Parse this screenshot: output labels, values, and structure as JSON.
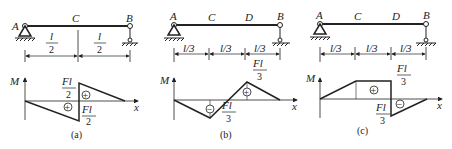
{
  "panels": [
    {
      "id": "a",
      "caption": "(a)",
      "points": {
        "left": "A",
        "mid": "C",
        "right": "B"
      },
      "dims": [
        {
          "num": "l",
          "den": "2"
        },
        {
          "num": "l",
          "den": "2"
        }
      ],
      "moment_labels": [
        {
          "num": "Fl",
          "den": "2"
        },
        {
          "num": "Fl",
          "den": "2"
        }
      ],
      "axis": {
        "y": "M",
        "x": "x"
      },
      "signs": [
        "+",
        "+"
      ]
    },
    {
      "id": "b",
      "caption": "(b)",
      "points": {
        "left": "A",
        "c": "C",
        "d": "D",
        "right": "B"
      },
      "dims": [
        "l/3",
        "l/3",
        "l/3"
      ],
      "moment_labels": [
        {
          "num": "Fl",
          "den": "3"
        },
        {
          "num": "Fl",
          "den": "3"
        }
      ],
      "axis": {
        "y": "M",
        "x": "x"
      },
      "signs": [
        "−",
        "+"
      ]
    },
    {
      "id": "c",
      "caption": "(c)",
      "points": {
        "left": "A",
        "c": "C",
        "d": "D",
        "right": "B"
      },
      "dims": [
        "l/3",
        "l/3",
        "l/3"
      ],
      "moment_labels": [
        {
          "num": "Fl",
          "den": "3"
        },
        {
          "num": "Fl",
          "den": "3"
        }
      ],
      "axis": {
        "y": "M",
        "x": "x"
      },
      "signs": [
        "+",
        "−"
      ]
    }
  ]
}
